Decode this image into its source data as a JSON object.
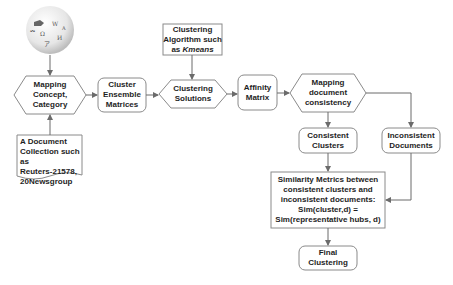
{
  "diagram": {
    "source_icon": "wikipedia-globe-icon",
    "nodes": {
      "mapping_concept": {
        "lines": [
          "Mapping",
          "Concept,",
          "Category"
        ],
        "shape": "hexagon"
      },
      "document_collection": {
        "lines": [
          "A Document",
          "Collection such as",
          "Reuters-21578,",
          "20Newsgroup"
        ],
        "shape": "document"
      },
      "cluster_ensemble": {
        "lines": [
          "Cluster",
          "Ensemble",
          "Matrices"
        ],
        "shape": "rounded-rect"
      },
      "clustering_algorithm": {
        "lines": [
          "Clustering",
          "Algorithm such",
          "as "
        ],
        "italic": "Kmeans",
        "shape": "rect"
      },
      "clustering_solutions": {
        "lines": [
          "Clustering",
          "Solutions"
        ],
        "shape": "hexagon"
      },
      "affinity_matrix": {
        "lines": [
          "Affinity",
          "Matrix"
        ],
        "shape": "rounded-rect"
      },
      "mapping_consistency": {
        "lines": [
          "Mapping",
          "document",
          "consistency"
        ],
        "shape": "hexagon"
      },
      "consistent_clusters": {
        "lines": [
          "Consistent",
          "Clusters"
        ],
        "shape": "rounded-rect"
      },
      "inconsistent_documents": {
        "lines": [
          "Inconsistent",
          "Documents"
        ],
        "shape": "rounded-rect"
      },
      "similarity_metrics": {
        "lines": [
          "Similarity Metrics between",
          "consistent clusters and",
          "inconsistent documents:",
          "Sim(cluster,d) =",
          "Sim(representative hubs, d)"
        ],
        "shape": "rect"
      },
      "final_clustering": {
        "lines": [
          "Final Clustering"
        ],
        "shape": "rounded-rect"
      }
    },
    "edges": [
      [
        "wikipedia",
        "mapping_concept"
      ],
      [
        "document_collection",
        "mapping_concept"
      ],
      [
        "mapping_concept",
        "cluster_ensemble"
      ],
      [
        "cluster_ensemble",
        "clustering_solutions"
      ],
      [
        "clustering_algorithm",
        "clustering_solutions"
      ],
      [
        "clustering_solutions",
        "affinity_matrix"
      ],
      [
        "affinity_matrix",
        "mapping_consistency"
      ],
      [
        "mapping_consistency",
        "consistent_clusters"
      ],
      [
        "mapping_consistency",
        "inconsistent_documents"
      ],
      [
        "consistent_clusters",
        "similarity_metrics"
      ],
      [
        "inconsistent_documents",
        "similarity_metrics"
      ],
      [
        "similarity_metrics",
        "final_clustering"
      ]
    ],
    "colors": {
      "stroke": "#8a8a8a",
      "arrow": "#6b6b6b",
      "fill": "#ffffff",
      "text": "#1e1e1e"
    }
  }
}
